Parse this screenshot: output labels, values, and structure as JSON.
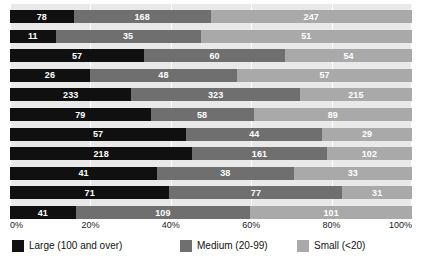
{
  "chart_data": {
    "type": "bar",
    "subtype": "100% stacked horizontal bar",
    "title": "",
    "xlabel": "",
    "ylabel": "",
    "categories": [
      "1",
      "2",
      "3",
      "4",
      "5",
      "6",
      "7",
      "8",
      "9",
      "10",
      "11"
    ],
    "xticks": [
      "0%",
      "20%",
      "40%",
      "60%",
      "80%",
      "100%"
    ],
    "xtick_values": [
      0,
      20,
      40,
      60,
      80,
      100
    ],
    "xlim": [
      0,
      100
    ],
    "grid": true,
    "legend_position": "bottom",
    "series": [
      {
        "name": "Large (100 and over)",
        "color": "#101010",
        "values": [
          78,
          11,
          57,
          26,
          233,
          79,
          57,
          218,
          41,
          71,
          41
        ]
      },
      {
        "name": "Medium (20-99)",
        "color": "#6f6f6f",
        "values": [
          168,
          35,
          60,
          48,
          323,
          58,
          44,
          161,
          38,
          77,
          109
        ]
      },
      {
        "name": "Small (<20)",
        "color": "#a9a9a9",
        "values": [
          247,
          51,
          54,
          57,
          215,
          89,
          29,
          102,
          33,
          31,
          101
        ]
      }
    ],
    "rows": [
      {
        "large": 78,
        "medium": 168,
        "small": 247
      },
      {
        "large": 11,
        "medium": 35,
        "small": 51
      },
      {
        "large": 57,
        "medium": 60,
        "small": 54
      },
      {
        "large": 26,
        "medium": 48,
        "small": 57
      },
      {
        "large": 233,
        "medium": 323,
        "small": 215
      },
      {
        "large": 79,
        "medium": 58,
        "small": 89
      },
      {
        "large": 57,
        "medium": 44,
        "small": 29
      },
      {
        "large": 218,
        "medium": 161,
        "small": 102
      },
      {
        "large": 41,
        "medium": 38,
        "small": 33
      },
      {
        "large": 71,
        "medium": 77,
        "small": 31
      },
      {
        "large": 41,
        "medium": 109,
        "small": 101
      }
    ]
  },
  "legend": {
    "items": [
      {
        "label": "Large (100 and over)",
        "color": "#101010"
      },
      {
        "label": "Medium (20-99)",
        "color": "#6f6f6f"
      },
      {
        "label": "Small (<20)",
        "color": "#a9a9a9"
      }
    ]
  },
  "colors": {
    "large": "#101010",
    "medium": "#6f6f6f",
    "small": "#a9a9a9",
    "plot_background": "#e9e9e9",
    "gridline": "#ffffff",
    "value_text": "#ffffff",
    "axis_text": "#1a1a1a"
  }
}
